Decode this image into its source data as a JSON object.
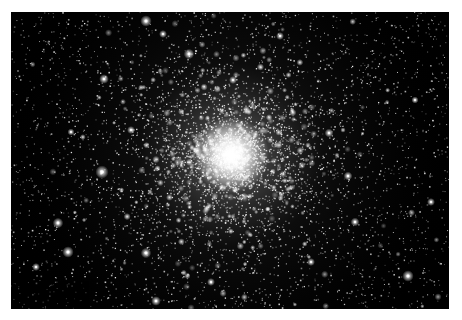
{
  "image": {
    "subject": "Globular star cluster",
    "alt": "Dense globular star cluster on black sky background",
    "frame": {
      "x": 11,
      "y": 12,
      "width": 438,
      "height": 297,
      "border_color": "#ffffff",
      "background": "#000000"
    },
    "core": {
      "cx": 220,
      "cy": 143,
      "radius": 75,
      "color": "#ffffff"
    },
    "halo_radius": 230,
    "star_tint": "#ffffff",
    "random_seed": 7,
    "field_star_count": 2600,
    "cluster_star_count": 3400,
    "bright_stars": [
      {
        "x": 135,
        "y": 9,
        "r": 2.6
      },
      {
        "x": 178,
        "y": 42,
        "r": 2.4
      },
      {
        "x": 93,
        "y": 67,
        "r": 2.2
      },
      {
        "x": 152,
        "y": 22,
        "r": 1.8
      },
      {
        "x": 91,
        "y": 160,
        "r": 3.0
      },
      {
        "x": 47,
        "y": 211,
        "r": 2.4
      },
      {
        "x": 57,
        "y": 240,
        "r": 2.6
      },
      {
        "x": 25,
        "y": 255,
        "r": 1.8
      },
      {
        "x": 135,
        "y": 241,
        "r": 2.4
      },
      {
        "x": 145,
        "y": 289,
        "r": 2.2
      },
      {
        "x": 397,
        "y": 264,
        "r": 2.6
      },
      {
        "x": 337,
        "y": 164,
        "r": 2.0
      },
      {
        "x": 318,
        "y": 121,
        "r": 2.0
      },
      {
        "x": 344,
        "y": 210,
        "r": 2.0
      },
      {
        "x": 269,
        "y": 24,
        "r": 1.8
      },
      {
        "x": 222,
        "y": 68,
        "r": 1.8
      },
      {
        "x": 404,
        "y": 88,
        "r": 1.6
      },
      {
        "x": 120,
        "y": 118,
        "r": 1.8
      },
      {
        "x": 300,
        "y": 250,
        "r": 1.8
      },
      {
        "x": 200,
        "y": 270,
        "r": 1.8
      },
      {
        "x": 60,
        "y": 120,
        "r": 1.6
      },
      {
        "x": 420,
        "y": 190,
        "r": 1.8
      }
    ]
  }
}
